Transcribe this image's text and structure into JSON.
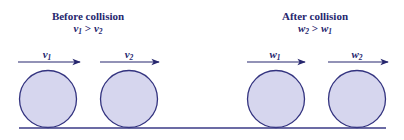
{
  "before": {
    "title": "Before collision",
    "condition": {
      "lhs": "v",
      "lhs_sub": "1",
      "op": " > ",
      "rhs": "v",
      "rhs_sub": "2"
    },
    "arrows": [
      {
        "label": "v",
        "sub": "1"
      },
      {
        "label": "v",
        "sub": "2"
      }
    ]
  },
  "after": {
    "title": "After collision",
    "condition": {
      "lhs": "w",
      "lhs_sub": "2",
      "op": " > ",
      "rhs": "w",
      "rhs_sub": "1"
    },
    "arrows": [
      {
        "label": "w",
        "sub": "1"
      },
      {
        "label": "w",
        "sub": "2"
      }
    ]
  },
  "colors": {
    "ink": "#26266e",
    "ball_fill": "#d6d6ee",
    "ball_stroke": "#33337f",
    "ground": "#3a3a86"
  }
}
